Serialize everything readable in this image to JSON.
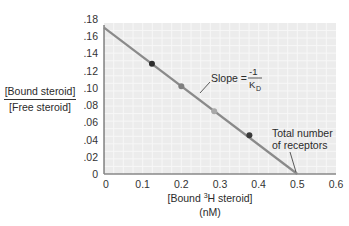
{
  "chart_data": {
    "type": "line",
    "title": "",
    "xlabel": "[Bound 3H steroid] (nM)",
    "ylabel": "[Bound steroid] / [Free steroid]",
    "xlim": [
      0,
      0.6
    ],
    "ylim": [
      0,
      0.18
    ],
    "x_ticks": [
      "0",
      "0.1",
      "0.2",
      "0.3",
      "0.4",
      "0.5",
      "0.6"
    ],
    "y_ticks": [
      "0",
      ".02",
      ".04",
      ".06",
      ".08",
      ".10",
      ".12",
      ".14",
      ".16",
      ".18"
    ],
    "grid": true,
    "legend": null,
    "series": [
      {
        "name": "fit line",
        "type": "line",
        "x": [
          0,
          0.5
        ],
        "y": [
          0.17,
          0.0
        ],
        "color": "#8a8a8a"
      },
      {
        "name": "data points",
        "type": "scatter",
        "x": [
          0.124,
          0.2,
          0.285,
          0.376
        ],
        "y": [
          0.128,
          0.102,
          0.073,
          0.045
        ],
        "colors": [
          "#2e2e2e",
          "#7e7e7e",
          "#a8a8a8",
          "#3a3a3a"
        ]
      }
    ],
    "annotations": [
      {
        "text": "Slope = -1/K_D",
        "points_to": [
          0.25,
          0.09
        ]
      },
      {
        "text": "Total number of receptors",
        "points_to": [
          0.5,
          0.0
        ]
      }
    ]
  },
  "labels": {
    "y_numerator": "[Bound steroid]",
    "y_denominator": "[Free steroid]",
    "x_line1_pre": "[Bound ",
    "x_line1_sup": "3",
    "x_line1_post": "H steroid]",
    "x_line2": "(nM)",
    "slope_word": "Slope =",
    "slope_num": "-1",
    "slope_den_k": "K",
    "slope_den_sub": "D",
    "receptors_line1": "Total number",
    "receptors_line2": "of receptors"
  }
}
